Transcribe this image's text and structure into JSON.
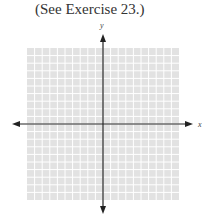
{
  "caption": "(See Exercise 23.)",
  "graph": {
    "x_label": "x",
    "y_label": "y",
    "grid": {
      "cells_x": 20,
      "cells_y": 20,
      "background": "#e2e2e2",
      "line_color": "#ffffff",
      "left": 27,
      "top": 48,
      "width": 152,
      "height": 152
    },
    "axis_color": "#222222"
  },
  "chart_data": {
    "type": "scatter",
    "title": "(See Exercise 23.)",
    "xlabel": "x",
    "ylabel": "y",
    "xlim": [
      -10,
      10
    ],
    "ylim": [
      -10,
      10
    ],
    "grid": true,
    "series": []
  }
}
